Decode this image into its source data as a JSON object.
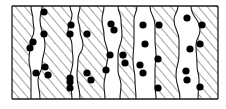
{
  "figure": {
    "description": "Schematic of columnar grains (hatched) with particles (black dots) located along grain boundaries",
    "frame": {
      "x": 12,
      "y": 6,
      "width": 206,
      "height": 93
    },
    "colors": {
      "line": "#1a1a1a",
      "dot": "#000000",
      "background": "#ffffff",
      "hatch": "#333333"
    },
    "grains": [
      {
        "left": [
          [
            12,
            6
          ],
          [
            12,
            99
          ]
        ],
        "right": [
          [
            31,
            6
          ],
          [
            33,
            20
          ],
          [
            34,
            30
          ],
          [
            30,
            45
          ],
          [
            29,
            60
          ],
          [
            31,
            75
          ],
          [
            31,
            99
          ]
        ]
      },
      {
        "left": [
          [
            42,
            6
          ],
          [
            40,
            20
          ],
          [
            45,
            45
          ],
          [
            42,
            65
          ],
          [
            38,
            80
          ],
          [
            40,
            99
          ]
        ],
        "right": [
          [
            70,
            6
          ],
          [
            72,
            15
          ],
          [
            68,
            30
          ],
          [
            72,
            45
          ],
          [
            73,
            60
          ],
          [
            70,
            80
          ],
          [
            72,
            99
          ]
        ]
      },
      {
        "left": [
          [
            80,
            6
          ],
          [
            78,
            18
          ],
          [
            80,
            30
          ],
          [
            83,
            45
          ],
          [
            78,
            60
          ],
          [
            77,
            75
          ],
          [
            80,
            99
          ]
        ],
        "right": [
          [
            104,
            6
          ],
          [
            102,
            20
          ],
          [
            104,
            35
          ],
          [
            108,
            55
          ],
          [
            106,
            70
          ],
          [
            104,
            85
          ],
          [
            105,
            99
          ]
        ]
      },
      {
        "left": [
          [
            118,
            6
          ],
          [
            121,
            20
          ],
          [
            122,
            35
          ],
          [
            118,
            55
          ],
          [
            118,
            70
          ],
          [
            121,
            85
          ],
          [
            120,
            99
          ]
        ],
        "right": [
          [
            137,
            6
          ],
          [
            134,
            20
          ],
          [
            134,
            40
          ],
          [
            133,
            60
          ],
          [
            135,
            80
          ],
          [
            136,
            99
          ]
        ]
      },
      {
        "left": [
          [
            150,
            6
          ],
          [
            155,
            25
          ],
          [
            155,
            40
          ],
          [
            156,
            55
          ],
          [
            155,
            70
          ],
          [
            155,
            85
          ],
          [
            156,
            99
          ]
        ],
        "right": [
          [
            178,
            6
          ],
          [
            174,
            20
          ],
          [
            179,
            40
          ],
          [
            179,
            55
          ],
          [
            176,
            75
          ],
          [
            180,
            99
          ]
        ]
      },
      {
        "left": [
          [
            191,
            6
          ],
          [
            200,
            30
          ],
          [
            196,
            45
          ],
          [
            197,
            65
          ],
          [
            199,
            80
          ],
          [
            198,
            99
          ]
        ],
        "right": [
          [
            218,
            6
          ],
          [
            218,
            99
          ]
        ]
      }
    ],
    "dots": [
      [
        44,
        12
      ],
      [
        44,
        34
      ],
      [
        33,
        42
      ],
      [
        30,
        48
      ],
      [
        36,
        73
      ],
      [
        45,
        67
      ],
      [
        48,
        75
      ],
      [
        71,
        25
      ],
      [
        70,
        34
      ],
      [
        87,
        34
      ],
      [
        70,
        78
      ],
      [
        70,
        82
      ],
      [
        70,
        88
      ],
      [
        87,
        73
      ],
      [
        91,
        80
      ],
      [
        111,
        24
      ],
      [
        114,
        30
      ],
      [
        110,
        55
      ],
      [
        123,
        55
      ],
      [
        125,
        63
      ],
      [
        106,
        70
      ],
      [
        143,
        25
      ],
      [
        145,
        44
      ],
      [
        140,
        65
      ],
      [
        143,
        73
      ],
      [
        159,
        25
      ],
      [
        158,
        59
      ],
      [
        158,
        88
      ],
      [
        187,
        18
      ],
      [
        190,
        49
      ],
      [
        186,
        71
      ],
      [
        187,
        80
      ],
      [
        202,
        25
      ],
      [
        200,
        44
      ],
      [
        200,
        87
      ]
    ],
    "dot_radius": 3.6
  }
}
